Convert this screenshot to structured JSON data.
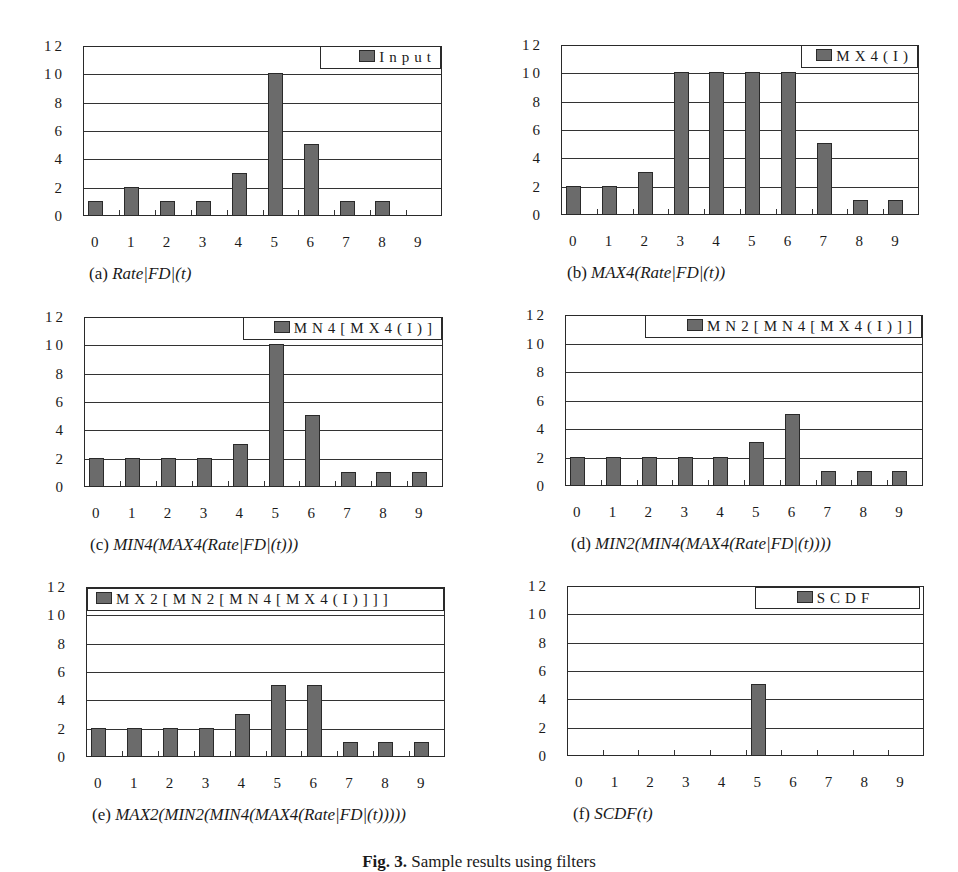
{
  "figure": {
    "caption_label": "Fig. 3.",
    "caption_text": "Sample results using filters"
  },
  "panels": [
    {
      "id": "a",
      "caption_prefix": "(a)",
      "caption_formula": "Rate|FD|(t)",
      "legend": "Input",
      "frame": {
        "left": 83,
        "top": 46,
        "right": 442,
        "bottom": 216
      },
      "legend_box": {
        "left": 320,
        "top": 46,
        "right": 441,
        "bottom": 69
      }
    },
    {
      "id": "b",
      "caption_prefix": "(b)",
      "caption_formula": "MAX4(Rate|FD|(t))",
      "legend": "MX4(I)",
      "frame": {
        "left": 561,
        "top": 45,
        "right": 919,
        "bottom": 215
      },
      "legend_box": {
        "left": 801,
        "top": 45,
        "right": 918,
        "bottom": 68
      }
    },
    {
      "id": "c",
      "caption_prefix": "(c)",
      "caption_formula": "MIN4(MAX4(Rate|FD|(t)))",
      "legend": "MN4[MX4(I)]",
      "frame": {
        "left": 84,
        "top": 317,
        "right": 443,
        "bottom": 487
      },
      "legend_box": {
        "left": 243,
        "top": 317,
        "right": 442,
        "bottom": 340
      }
    },
    {
      "id": "d",
      "caption_prefix": "(d)",
      "caption_formula": "MIN2(MIN4(MAX4(Rate|FD|(t))))",
      "legend": "MN2[MN4[MX4(I)]]",
      "frame": {
        "left": 565,
        "top": 315,
        "right": 923,
        "bottom": 486
      },
      "legend_box": {
        "left": 645,
        "top": 315,
        "right": 922,
        "bottom": 338
      }
    },
    {
      "id": "e",
      "caption_prefix": "(e)",
      "caption_formula": "MAX2(MIN2(MIN4(MAX4(Rate|FD|(t)))))",
      "legend": "MX2[MN2[MN4[MX4(I)]]]",
      "frame": {
        "left": 86,
        "top": 587,
        "right": 445,
        "bottom": 757
      },
      "legend_box": {
        "left": 87,
        "top": 588,
        "right": 444,
        "bottom": 611
      }
    },
    {
      "id": "f",
      "caption_prefix": "(f)",
      "caption_formula": "SCDF(t)",
      "legend": "SCDF",
      "frame": {
        "left": 567,
        "top": 586,
        "right": 924,
        "bottom": 756
      },
      "legend_box": {
        "left": 755,
        "top": 587,
        "right": 920,
        "bottom": 609
      }
    }
  ],
  "chart_data": [
    {
      "type": "bar",
      "title": "(a) Rate|FD|(t)",
      "categories": [
        "0",
        "1",
        "2",
        "3",
        "4",
        "5",
        "6",
        "7",
        "8",
        "9"
      ],
      "series": [
        {
          "name": "Input",
          "values": [
            1,
            2,
            1,
            1,
            3,
            10,
            5,
            1,
            1,
            0
          ]
        }
      ],
      "xlabel": "",
      "ylabel": "",
      "yticks": [
        "0",
        "2",
        "4",
        "6",
        "8",
        "10",
        "12"
      ],
      "ylim": [
        0,
        12
      ],
      "grid": true,
      "legend_position": "top-right"
    },
    {
      "type": "bar",
      "title": "(b) MAX4(Rate|FD|(t))",
      "categories": [
        "0",
        "1",
        "2",
        "3",
        "4",
        "5",
        "6",
        "7",
        "8",
        "9"
      ],
      "series": [
        {
          "name": "MX4(I)",
          "values": [
            2,
            2,
            3,
            10,
            10,
            10,
            10,
            5,
            1,
            1
          ]
        }
      ],
      "xlabel": "",
      "ylabel": "",
      "yticks": [
        "0",
        "2",
        "4",
        "6",
        "8",
        "10",
        "12"
      ],
      "ylim": [
        0,
        12
      ],
      "grid": true,
      "legend_position": "top-right"
    },
    {
      "type": "bar",
      "title": "(c) MIN4(MAX4(Rate|FD|(t)))",
      "categories": [
        "0",
        "1",
        "2",
        "3",
        "4",
        "5",
        "6",
        "7",
        "8",
        "9"
      ],
      "series": [
        {
          "name": "MN4[MX4(I)]",
          "values": [
            2,
            2,
            2,
            2,
            3,
            10,
            5,
            1,
            1,
            1
          ]
        }
      ],
      "xlabel": "",
      "ylabel": "",
      "yticks": [
        "0",
        "2",
        "4",
        "6",
        "8",
        "10",
        "12"
      ],
      "ylim": [
        0,
        12
      ],
      "grid": true,
      "legend_position": "top-right"
    },
    {
      "type": "bar",
      "title": "(d) MIN2(MIN4(MAX4(Rate|FD|(t))))",
      "categories": [
        "0",
        "1",
        "2",
        "3",
        "4",
        "5",
        "6",
        "7",
        "8",
        "9"
      ],
      "series": [
        {
          "name": "MN2[MN4[MX4(I)]]",
          "values": [
            2,
            2,
            2,
            2,
            2,
            3,
            5,
            1,
            1,
            1
          ]
        }
      ],
      "xlabel": "",
      "ylabel": "",
      "yticks": [
        "0",
        "2",
        "4",
        "6",
        "8",
        "10",
        "12"
      ],
      "ylim": [
        0,
        12
      ],
      "grid": true,
      "legend_position": "top-right"
    },
    {
      "type": "bar",
      "title": "(e) MAX2(MIN2(MIN4(MAX4(Rate|FD|(t)))))",
      "categories": [
        "0",
        "1",
        "2",
        "3",
        "4",
        "5",
        "6",
        "7",
        "8",
        "9"
      ],
      "series": [
        {
          "name": "MX2[MN2[MN4[MX4(I)]]]",
          "values": [
            2,
            2,
            2,
            2,
            3,
            5,
            5,
            1,
            1,
            1
          ]
        }
      ],
      "xlabel": "",
      "ylabel": "",
      "yticks": [
        "0",
        "2",
        "4",
        "6",
        "8",
        "10",
        "12"
      ],
      "ylim": [
        0,
        12
      ],
      "grid": true,
      "legend_position": "top"
    },
    {
      "type": "bar",
      "title": "(f) SCDF(t)",
      "categories": [
        "0",
        "1",
        "2",
        "3",
        "4",
        "5",
        "6",
        "7",
        "8",
        "9"
      ],
      "series": [
        {
          "name": "SCDF",
          "values": [
            0,
            0,
            0,
            0,
            0,
            5,
            0,
            0,
            0,
            0
          ]
        }
      ],
      "xlabel": "",
      "ylabel": "",
      "yticks": [
        "0",
        "2",
        "4",
        "6",
        "8",
        "10",
        "12"
      ],
      "ylim": [
        0,
        12
      ],
      "grid": true,
      "legend_position": "top-right"
    }
  ],
  "colors": {
    "bar_fill": "#6b6b6b",
    "bar_border": "#2a2a2a",
    "grid": "#333333",
    "background": "#ffffff"
  }
}
